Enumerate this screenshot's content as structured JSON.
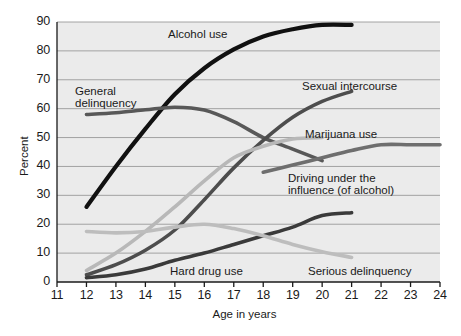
{
  "chart_data": {
    "type": "line",
    "title": "",
    "subtitle": "",
    "xlabel": "Age in years",
    "ylabel": "Percent",
    "xlim": [
      11,
      24
    ],
    "ylim": [
      0,
      90
    ],
    "xticks": [
      "11",
      "12",
      "13",
      "14",
      "15",
      "16",
      "17",
      "18",
      "19",
      "20",
      "21",
      "22",
      "23",
      "24"
    ],
    "yticks": [
      "0",
      "10",
      "20",
      "30",
      "40",
      "50",
      "60",
      "70",
      "80",
      "90"
    ],
    "grid": "horizontal",
    "legend_position": "inline-annotations",
    "series": [
      {
        "name": "Alcohol use",
        "color": "#111111",
        "width": 4.2,
        "x": [
          12,
          13,
          14,
          15,
          16,
          17,
          18,
          19,
          20,
          21
        ],
        "values": [
          26,
          40,
          53,
          65,
          74,
          80.5,
          85,
          87.5,
          89,
          89
        ]
      },
      {
        "name": "General delinquency",
        "color": "#585858",
        "width": 3.6,
        "x": [
          12,
          13,
          14,
          15,
          16,
          17,
          18,
          19,
          20
        ],
        "values": [
          58,
          58.6,
          59.6,
          60.5,
          59.5,
          55.5,
          50,
          46,
          42
        ]
      },
      {
        "name": "Sexual intercourse",
        "color": "#4d4d4d",
        "width": 3.6,
        "x": [
          12,
          13,
          14,
          15,
          16,
          17,
          18,
          19,
          20,
          21
        ],
        "values": [
          2.5,
          6,
          11,
          18,
          28.5,
          39.5,
          49,
          57,
          62.5,
          66
        ]
      },
      {
        "name": "Marijuana use",
        "color": "#b8b8b8",
        "width": 3.6,
        "x": [
          12,
          13,
          14,
          15,
          16,
          17,
          18,
          19,
          20
        ],
        "values": [
          4,
          10,
          17.5,
          26,
          35,
          43,
          47,
          49.5,
          50
        ]
      },
      {
        "name": "Driving under the influence (of alcohol)",
        "color": "#6e6e6e",
        "width": 3.6,
        "x": [
          18,
          19,
          20,
          21,
          22,
          23,
          24
        ],
        "values": [
          38,
          40.5,
          43,
          45.5,
          47.5,
          47.5,
          47.5
        ]
      },
      {
        "name": "Hard drug use",
        "color": "#3a3a3a",
        "width": 3.6,
        "x": [
          12,
          13,
          14,
          15,
          16,
          17,
          18,
          19,
          20,
          21
        ],
        "values": [
          1.5,
          2.5,
          4.5,
          7.5,
          10,
          13,
          16,
          19,
          23,
          24
        ]
      },
      {
        "name": "Serious delinquency",
        "color": "#bdbdbd",
        "width": 3.6,
        "x": [
          12,
          13,
          14,
          15,
          16,
          17,
          18,
          19,
          20,
          21
        ],
        "values": [
          17.5,
          17,
          17.5,
          19,
          20,
          18.5,
          16,
          13,
          10.5,
          8.5
        ]
      }
    ],
    "annotations": [
      {
        "text": "Alcohol use",
        "x": 168,
        "y": 28,
        "align": "left"
      },
      {
        "text": "General",
        "x": 75,
        "y": 85,
        "align": "left"
      },
      {
        "text": "delinquency",
        "x": 75,
        "y": 97,
        "align": "left"
      },
      {
        "text": "Sexual intercourse",
        "x": 302,
        "y": 80,
        "align": "left"
      },
      {
        "text": "Marijuana use",
        "x": 305,
        "y": 128,
        "align": "left"
      },
      {
        "text": "Driving under the",
        "x": 288,
        "y": 172,
        "align": "left"
      },
      {
        "text": "influence (of alcohol)",
        "x": 288,
        "y": 184,
        "align": "left"
      },
      {
        "text": "Hard drug use",
        "x": 170,
        "y": 265,
        "align": "left"
      },
      {
        "text": "Serious delinquency",
        "x": 308,
        "y": 265,
        "align": "left"
      }
    ]
  },
  "axis": {
    "y_label": "Percent",
    "x_label": "Age in years"
  },
  "style": {
    "plot_background": "#ebebeb",
    "gridline_color": "#9a9a9a",
    "axis_color": "#1a1a1a",
    "text_color": "#1a1a1a"
  }
}
